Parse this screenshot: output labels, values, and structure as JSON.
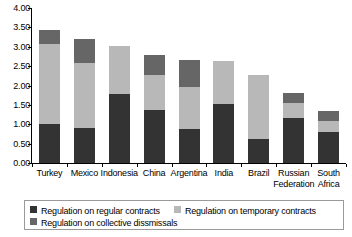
{
  "chart_data": {
    "type": "bar",
    "subtype": "stacked-vertical",
    "title": "",
    "subtitle": "",
    "xlabel": "",
    "ylabel": "",
    "ylim": [
      0.0,
      4.0
    ],
    "ytick_step": 0.5,
    "ytick_labels": [
      "4.00",
      "3.50",
      "3.00",
      "2.50",
      "2.00",
      "1.50",
      "1.00",
      "0.50",
      "0.00"
    ],
    "ytick_values": [
      4.0,
      3.5,
      3.0,
      2.5,
      2.0,
      1.5,
      1.0,
      0.5,
      0.0
    ],
    "grid": false,
    "legend_position": "bottom",
    "categories": [
      "Turkey",
      "Mexico",
      "Indonesia",
      "China",
      "Argentina",
      "India",
      "Brazil",
      "Russian\nFederation",
      "South\nAfrica"
    ],
    "series": [
      {
        "name": "Regulation on regular contracts",
        "color": "#333333",
        "values": [
          1.0,
          0.91,
          1.77,
          1.36,
          0.87,
          1.52,
          0.62,
          1.16,
          0.79
        ]
      },
      {
        "name": "Regulation on temporary contracts",
        "color": "#b8b8b8",
        "values": [
          2.07,
          1.67,
          1.24,
          0.92,
          1.1,
          1.1,
          1.65,
          0.39,
          0.29
        ]
      },
      {
        "name": "Regulation on collective dissmissals",
        "color": "#666666",
        "values": [
          0.37,
          0.62,
          0.0,
          0.52,
          0.69,
          0.0,
          0.0,
          0.25,
          0.27
        ]
      }
    ],
    "totals": [
      3.44,
      3.2,
      3.01,
      2.8,
      2.66,
      2.62,
      2.27,
      1.8,
      1.35
    ]
  },
  "legend": {
    "items": [
      {
        "label": "Regulation on regular contracts",
        "color": "#333333"
      },
      {
        "label": "Regulation on temporary contracts",
        "color": "#b8b8b8"
      },
      {
        "label": "Regulation on collective dissmissals",
        "color": "#666666"
      }
    ]
  },
  "colors": {
    "regular": "#333333",
    "temporary": "#b8b8b8",
    "collective": "#666666",
    "axis": "#000000",
    "legend_border": "#9a9a9a",
    "background": "#ffffff"
  }
}
